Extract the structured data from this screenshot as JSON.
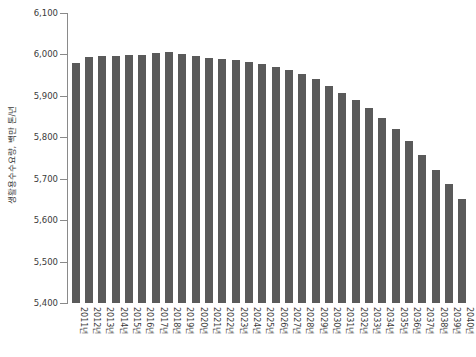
{
  "chart_data": {
    "type": "bar",
    "title": "",
    "xlabel": "",
    "ylabel": "생활용수수요량, 백만 톤/년",
    "ylim": [
      5400,
      6100
    ],
    "yticks": [
      5400,
      5500,
      5600,
      5700,
      5800,
      5900,
      6000,
      6100
    ],
    "ytick_labels": [
      "5,400",
      "5,500",
      "5,600",
      "5,700",
      "5,800",
      "5,900",
      "6,000",
      "6,100"
    ],
    "grid": false,
    "legend": null,
    "bar_color": "#5a5a5a",
    "axis_color": "#8a8a8a",
    "text_color": "#3b3b3b",
    "categories": [
      "2011년",
      "2012년",
      "2013년",
      "2014년",
      "2015년",
      "2016년",
      "2017년",
      "2018년",
      "2019년",
      "2020년",
      "2021년",
      "2022년",
      "2023년",
      "2024년",
      "2025년",
      "2026년",
      "2027년",
      "2028년",
      "2029년",
      "2030년",
      "2031년",
      "2032년",
      "2033년",
      "2034년",
      "2035년",
      "2036년",
      "2037년",
      "2038년",
      "2039년",
      "2040년"
    ],
    "values": [
      5980,
      5995,
      5996,
      5997,
      5998,
      5999,
      6004,
      6005,
      6002,
      5996,
      5992,
      5990,
      5986,
      5982,
      5977,
      5970,
      5962,
      5952,
      5940,
      5925,
      5908,
      5890,
      5870,
      5846,
      5820,
      5790,
      5758,
      5722,
      5688,
      5651
    ]
  }
}
